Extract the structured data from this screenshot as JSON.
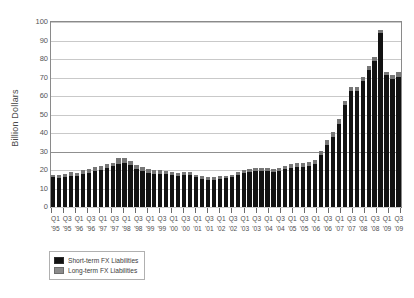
{
  "chart_data": {
    "type": "bar",
    "subtype": "stacked-bar",
    "title": "",
    "xlabel": "",
    "ylabel": "Billion Dollars",
    "ylim": [
      0,
      100
    ],
    "ytick_values": [
      100,
      90,
      80,
      70,
      60,
      50,
      40,
      30,
      20,
      10,
      0
    ],
    "ytick_labels": [
      "100",
      "90",
      "80",
      "70",
      "60",
      "50",
      "40",
      "30",
      "20",
      "10",
      "0"
    ],
    "grid": "horizontal",
    "legend_position": "below-left",
    "categories": [
      "Q1 '95",
      "Q2 '95",
      "Q3 '95",
      "Q4 '95",
      "Q1 '96",
      "Q2 '96",
      "Q3 '96",
      "Q4 '96",
      "Q1 '97",
      "Q2 '97",
      "Q3 '97",
      "Q4 '97",
      "Q1 '98",
      "Q2 '98",
      "Q3 '98",
      "Q4 '98",
      "Q1 '99",
      "Q2 '99",
      "Q3 '99",
      "Q4 '99",
      "Q1 '00",
      "Q2 '00",
      "Q3 '00",
      "Q4 '00",
      "Q1 '01",
      "Q2 '01",
      "Q3 '01",
      "Q4 '01",
      "Q1 '02",
      "Q2 '02",
      "Q3 '02",
      "Q4 '02",
      "Q1 '03",
      "Q2 '03",
      "Q3 '03",
      "Q4 '03",
      "Q1 '04",
      "Q2 '04",
      "Q3 '04",
      "Q4 '04",
      "Q1 '05",
      "Q2 '05",
      "Q3 '05",
      "Q4 '05",
      "Q1 '06",
      "Q2 '06",
      "Q3 '06",
      "Q4 '06",
      "Q1 '07",
      "Q2 '07",
      "Q3 '07",
      "Q4 '07",
      "Q1 '08",
      "Q2 '08",
      "Q3 '08",
      "Q4 '08",
      "Q1 '09",
      "Q2 '09",
      "Q3 '09"
    ],
    "xtick_labels": [
      {
        "quarter": "Q1",
        "year": "'95"
      },
      {
        "quarter": "",
        "year": ""
      },
      {
        "quarter": "Q3",
        "year": "'95"
      },
      {
        "quarter": "",
        "year": ""
      },
      {
        "quarter": "Q1",
        "year": "'96"
      },
      {
        "quarter": "",
        "year": ""
      },
      {
        "quarter": "Q3",
        "year": "'96"
      },
      {
        "quarter": "",
        "year": ""
      },
      {
        "quarter": "Q1",
        "year": "'97"
      },
      {
        "quarter": "",
        "year": ""
      },
      {
        "quarter": "Q3",
        "year": "'97"
      },
      {
        "quarter": "",
        "year": ""
      },
      {
        "quarter": "Q1",
        "year": "'98"
      },
      {
        "quarter": "",
        "year": ""
      },
      {
        "quarter": "Q3",
        "year": "'98"
      },
      {
        "quarter": "",
        "year": ""
      },
      {
        "quarter": "Q1",
        "year": "'99"
      },
      {
        "quarter": "",
        "year": ""
      },
      {
        "quarter": "Q3",
        "year": "'99"
      },
      {
        "quarter": "",
        "year": ""
      },
      {
        "quarter": "Q1",
        "year": "'00"
      },
      {
        "quarter": "",
        "year": ""
      },
      {
        "quarter": "Q3",
        "year": "'00"
      },
      {
        "quarter": "",
        "year": ""
      },
      {
        "quarter": "Q1",
        "year": "'01"
      },
      {
        "quarter": "",
        "year": ""
      },
      {
        "quarter": "Q3",
        "year": "'01"
      },
      {
        "quarter": "",
        "year": ""
      },
      {
        "quarter": "Q1",
        "year": "'02"
      },
      {
        "quarter": "",
        "year": ""
      },
      {
        "quarter": "Q3",
        "year": "'02"
      },
      {
        "quarter": "",
        "year": ""
      },
      {
        "quarter": "Q1",
        "year": "'03"
      },
      {
        "quarter": "",
        "year": ""
      },
      {
        "quarter": "Q3",
        "year": "'03"
      },
      {
        "quarter": "",
        "year": ""
      },
      {
        "quarter": "Q1",
        "year": "'04"
      },
      {
        "quarter": "",
        "year": ""
      },
      {
        "quarter": "Q3",
        "year": "'04"
      },
      {
        "quarter": "",
        "year": ""
      },
      {
        "quarter": "Q1",
        "year": "'05"
      },
      {
        "quarter": "",
        "year": ""
      },
      {
        "quarter": "Q3",
        "year": "'05"
      },
      {
        "quarter": "",
        "year": ""
      },
      {
        "quarter": "Q1",
        "year": "'06"
      },
      {
        "quarter": "",
        "year": ""
      },
      {
        "quarter": "Q3",
        "year": "'06"
      },
      {
        "quarter": "",
        "year": ""
      },
      {
        "quarter": "Q1",
        "year": "'07"
      },
      {
        "quarter": "",
        "year": ""
      },
      {
        "quarter": "Q3",
        "year": "'07"
      },
      {
        "quarter": "",
        "year": ""
      },
      {
        "quarter": "Q1",
        "year": "'08"
      },
      {
        "quarter": "",
        "year": ""
      },
      {
        "quarter": "Q3",
        "year": "'08"
      },
      {
        "quarter": "",
        "year": ""
      },
      {
        "quarter": "Q1",
        "year": "'09"
      },
      {
        "quarter": "",
        "year": ""
      },
      {
        "quarter": "Q3",
        "year": "'09"
      }
    ],
    "series": [
      {
        "name": "Short-term FX Liabilities",
        "color": "#121212",
        "values": [
          16.0,
          15.8,
          16.0,
          17.0,
          16.5,
          17.8,
          18.5,
          19.5,
          20.0,
          21.0,
          22.0,
          23.5,
          24.0,
          22.5,
          20.5,
          19.5,
          18.5,
          18.0,
          17.8,
          17.8,
          17.5,
          17.0,
          17.5,
          17.5,
          16.0,
          15.0,
          14.5,
          14.5,
          15.0,
          15.5,
          16.0,
          17.5,
          18.5,
          19.0,
          19.5,
          19.5,
          19.5,
          19.0,
          19.5,
          20.5,
          21.0,
          21.5,
          21.5,
          22.0,
          23.0,
          28.0,
          33.5,
          38.0,
          45.0,
          55.0,
          62.5,
          62.5,
          68.0,
          74.0,
          79.0,
          94.0,
          71.5,
          69.0,
          70.5
        ]
      },
      {
        "name": "Long-term FX Liabilities",
        "color": "#767676",
        "values": [
          1.5,
          1.5,
          2.0,
          2.0,
          2.0,
          2.0,
          2.0,
          2.0,
          2.0,
          2.0,
          2.0,
          3.0,
          2.5,
          2.5,
          2.0,
          2.0,
          2.0,
          2.0,
          2.0,
          1.7,
          1.5,
          1.5,
          1.5,
          1.5,
          1.5,
          1.5,
          1.5,
          1.5,
          1.5,
          1.5,
          1.5,
          1.5,
          1.5,
          1.5,
          1.5,
          1.5,
          1.5,
          1.5,
          1.5,
          1.5,
          2.0,
          2.5,
          2.5,
          2.5,
          2.5,
          2.5,
          2.5,
          2.5,
          2.5,
          2.5,
          2.5,
          2.5,
          2.5,
          2.0,
          2.0,
          1.5,
          1.5,
          2.5,
          2.5
        ]
      }
    ],
    "legend": [
      {
        "label": "Short-term FX Liabilities",
        "color": "#121212",
        "swatch": "swatch-short"
      },
      {
        "label": "Long-term FX Liabilities",
        "color": "#8b8b8b",
        "swatch": "swatch-long"
      }
    ]
  }
}
